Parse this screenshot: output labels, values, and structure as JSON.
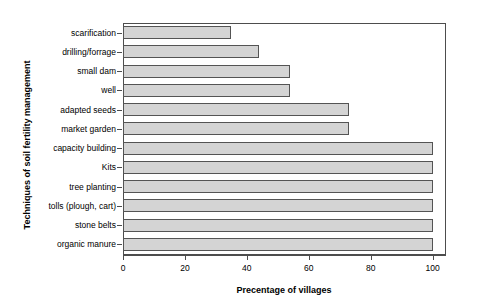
{
  "chart_data": {
    "type": "bar",
    "orientation": "horizontal",
    "title": "",
    "xlabel": "Precentage of villages",
    "ylabel": "Techniques of soil fertility management",
    "categories": [
      "scarification",
      "drilling/forrage",
      "small dam",
      "well",
      "adapted seeds",
      "market garden",
      "capacity building",
      "Kits",
      "tree planting",
      "tolls (plough, cart)",
      "stone belts",
      "organic manure"
    ],
    "values": [
      35,
      44,
      54,
      54,
      73,
      73,
      100,
      100,
      100,
      100,
      100,
      100
    ],
    "xlim": [
      0,
      104
    ],
    "xticks": [
      0,
      20,
      40,
      60,
      80,
      100
    ],
    "xtick_labels": [
      "0",
      "20",
      "40",
      "60",
      "80",
      "100"
    ],
    "grid": false,
    "legend": null,
    "bar_fill": "#d4d4d4",
    "bar_border": "#545454",
    "axis_color": "#4d4d4d",
    "background": "#ffffff"
  }
}
